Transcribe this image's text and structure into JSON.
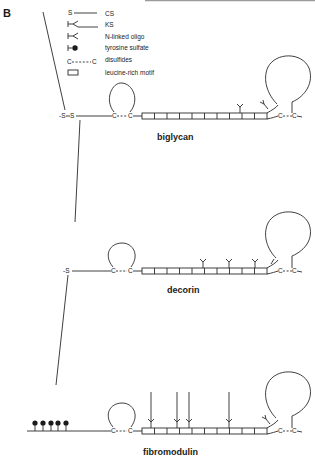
{
  "panel_label": "B",
  "legend": {
    "items": [
      {
        "symbol": "S",
        "label": "CS"
      },
      {
        "symbol": "ks-branch",
        "label": "KS"
      },
      {
        "symbol": "n-linked-branch",
        "label": "N-linked oligo"
      },
      {
        "symbol": "lollipop",
        "label": "tyrosine sulfate"
      },
      {
        "symbol": "C---C",
        "label": "disulfides"
      },
      {
        "symbol": "rectangle",
        "label": "leucine-rich motif"
      }
    ]
  },
  "molecules": [
    {
      "name": "biglycan",
      "cs_chains": 2,
      "n_linked_oligos": 2,
      "ks_chains": 0,
      "tyrosine_sulfates": 0,
      "leucine_rich_motifs": 10
    },
    {
      "name": "decorin",
      "cs_chains": 1,
      "n_linked_oligos": 4,
      "ks_chains": 0,
      "tyrosine_sulfates": 0,
      "leucine_rich_motifs": 10
    },
    {
      "name": "fibromodulin",
      "cs_chains": 0,
      "n_linked_oligos": 1,
      "ks_chains": 4,
      "tyrosine_sulfates": 5,
      "leucine_rich_motifs": 10
    }
  ],
  "glyphs": {
    "S": "S",
    "C": "C"
  }
}
